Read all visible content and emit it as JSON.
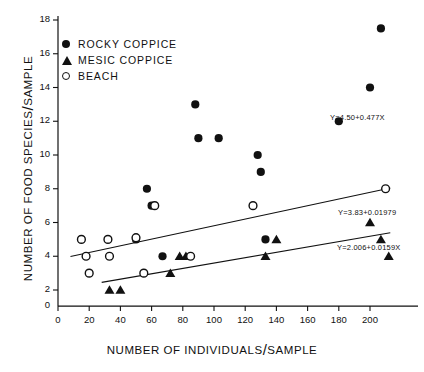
{
  "chart_data": {
    "type": "scatter",
    "title": "",
    "xlabel": "NUMBER OF INDIVIDUALS/SAMPLE",
    "ylabel": "NUMBER OF FOOD SPECIES/SAMPLE",
    "xlim": [
      0,
      213
    ],
    "ylim": [
      0.9,
      18.6
    ],
    "xticks": [
      0,
      20,
      40,
      60,
      80,
      100,
      120,
      140,
      160,
      180,
      200
    ],
    "yticks": [
      2,
      4,
      6,
      8,
      10,
      12,
      14,
      16,
      18
    ],
    "grid": false,
    "legend_position": "top-left",
    "series": [
      {
        "name": "ROCKY COPPICE",
        "marker": "filled-circle",
        "color": "#111111",
        "points": [
          [
            50,
            5.0
          ],
          [
            57,
            8.0
          ],
          [
            60,
            7.0
          ],
          [
            67,
            4.0
          ],
          [
            88,
            13.0
          ],
          [
            90,
            11.0
          ],
          [
            103,
            11.0
          ],
          [
            128,
            10.0
          ],
          [
            130,
            9.0
          ],
          [
            133,
            5.0
          ],
          [
            180,
            12.0
          ],
          [
            200,
            14.0
          ],
          [
            207,
            17.5
          ]
        ],
        "fit_label": "Y=4.50+0.477X",
        "fit_intercept": 4.5,
        "fit_slope": 0.477,
        "fit_x_range": [
          42,
          205
        ]
      },
      {
        "name": "MESIC COPPICE",
        "marker": "filled-triangle",
        "color": "#111111",
        "points": [
          [
            33,
            2.0
          ],
          [
            40,
            2.0
          ],
          [
            72,
            3.0
          ],
          [
            78,
            4.0
          ],
          [
            82,
            4.0
          ],
          [
            133,
            4.0
          ],
          [
            140,
            5.0
          ],
          [
            200,
            6.0
          ],
          [
            207,
            5.0
          ],
          [
            212,
            4.0
          ]
        ],
        "fit_label": "Y=2.006+0.0159X",
        "fit_intercept": 2.006,
        "fit_slope": 0.0159,
        "fit_x_range": [
          28,
          213
        ]
      },
      {
        "name": "BEACH",
        "marker": "open-circle",
        "color": "#111111",
        "points": [
          [
            15,
            5.0
          ],
          [
            18,
            4.0
          ],
          [
            20,
            3.0
          ],
          [
            32,
            5.0
          ],
          [
            33,
            4.0
          ],
          [
            50,
            5.1
          ],
          [
            55,
            3.0
          ],
          [
            62,
            7.0
          ],
          [
            85,
            4.0
          ],
          [
            125,
            7.0
          ],
          [
            210,
            8.0
          ]
        ],
        "fit_label": "Y=3.83+0.01979",
        "fit_intercept": 3.83,
        "fit_slope": 0.01979,
        "fit_x_range": [
          8,
          213
        ]
      }
    ]
  },
  "legend": {
    "items": [
      {
        "label": "ROCKY  COPPICE",
        "marker": "filled-circle"
      },
      {
        "label": "MESIC COPPICE",
        "marker": "filled-triangle"
      },
      {
        "label": "BEACH",
        "marker": "open-circle"
      }
    ]
  },
  "axes": {
    "x_title_a": "NUMBER OF INDIVIDUALS",
    "x_title_b": "SAMPLE",
    "y_title_a": "NUMBER OF FOOD SPECIES",
    "y_title_b": "SAMPLE",
    "slash": "/"
  }
}
